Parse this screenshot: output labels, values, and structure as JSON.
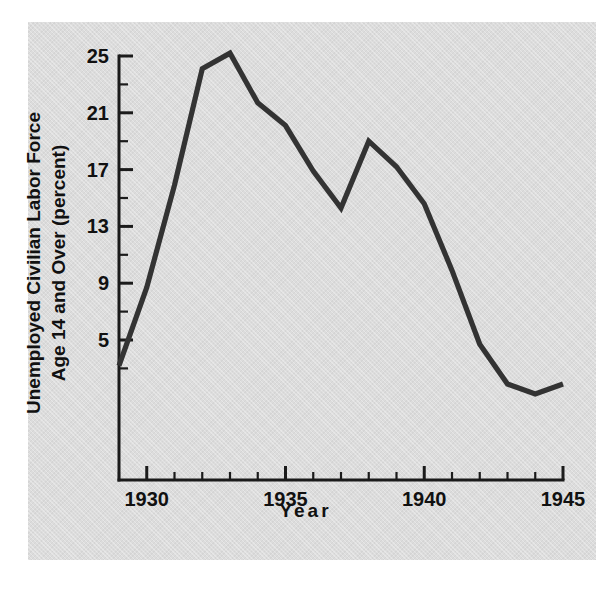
{
  "figure": {
    "background_color": "#dcdcdc",
    "line_color": "#333333",
    "axis_color": "#1b1b1b",
    "caption_fragment": " "
  },
  "chart_data": {
    "type": "line",
    "title": "",
    "xlabel": "Year",
    "ylabel": "Unemployed Civilian Labor Force Age 14 and Over (percent)",
    "ylabel_line1": "Unemployed Civilian Labor Force",
    "ylabel_line2": "Age 14 and Over (percent)",
    "xlim": [
      1929,
      1945
    ],
    "ylim": [
      0.6,
      25.6
    ],
    "grid": false,
    "legend": "none",
    "x_major_ticks": [
      1930,
      1935,
      1940,
      1945
    ],
    "x_tick_labels": [
      "1930",
      "1935",
      "1940",
      "1945"
    ],
    "x_minor_ticks": [
      1929,
      1931,
      1932,
      1933,
      1934,
      1936,
      1937,
      1938,
      1939,
      1941,
      1942,
      1943,
      1944
    ],
    "y_major_ticks": [
      5,
      9,
      13,
      17,
      21,
      25
    ],
    "y_tick_labels": [
      "5",
      "9",
      "13",
      "17",
      "21",
      "25"
    ],
    "y_minor_ticks": [
      3,
      7,
      11,
      15,
      19,
      23
    ],
    "x": [
      1929,
      1930,
      1931,
      1932,
      1933,
      1934,
      1935,
      1936,
      1937,
      1938,
      1939,
      1940,
      1941,
      1942,
      1943,
      1944,
      1945
    ],
    "values": [
      3.2,
      8.7,
      15.9,
      24.1,
      25.2,
      21.7,
      20.1,
      16.9,
      14.3,
      19.0,
      17.2,
      14.6,
      9.9,
      4.7,
      1.9,
      1.2,
      1.9
    ],
    "series": [
      {
        "name": "Unemployment rate",
        "values": [
          3.2,
          8.7,
          15.9,
          24.1,
          25.2,
          21.7,
          20.1,
          16.9,
          14.3,
          19.0,
          17.2,
          14.6,
          9.9,
          4.7,
          1.9,
          1.2,
          1.9
        ]
      }
    ]
  }
}
